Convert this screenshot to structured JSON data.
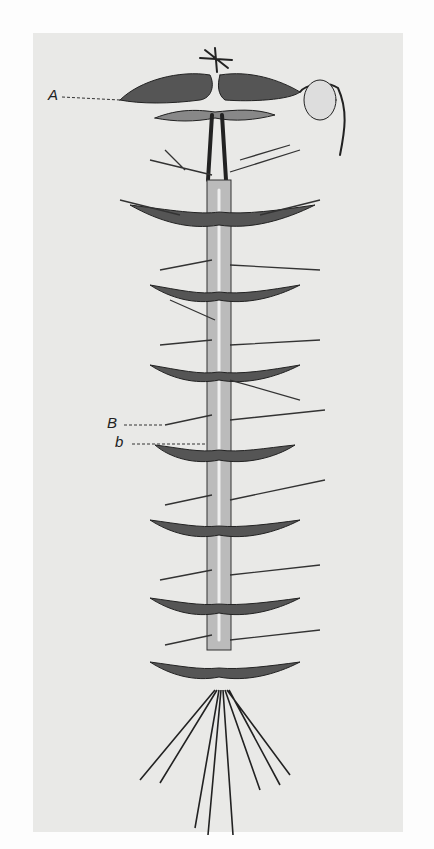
{
  "figure": {
    "labels": [
      {
        "id": "A",
        "text": "A"
      },
      {
        "id": "B",
        "text": "B"
      },
      {
        "id": "b",
        "text": "b"
      }
    ],
    "segments": 7,
    "colors": {
      "background": "#e9e9e7",
      "ink": "#222222"
    }
  }
}
